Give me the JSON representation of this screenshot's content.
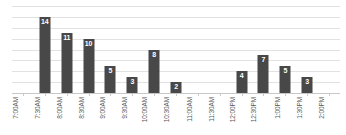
{
  "chart_data": {
    "type": "bar",
    "title": "",
    "subtitle": "",
    "xlabel": "",
    "ylabel": "",
    "categories": [
      "7:00AM",
      "7:30AM",
      "8:00AM",
      "8:30AM",
      "9:00AM",
      "9:30AM",
      "10:00AM",
      "10:30AM",
      "11:00AM",
      "11:30AM",
      "12:00PM",
      "12:30PM",
      "1:00PM",
      "1:30PM",
      "2:00PM"
    ],
    "values": [
      0,
      14,
      11,
      10,
      5,
      3,
      8,
      2,
      0,
      0,
      4,
      7,
      5,
      3,
      0
    ],
    "value_labels": [
      "",
      "14",
      "11",
      "10",
      "5",
      "3",
      "8",
      "2",
      "",
      "",
      "4",
      "7",
      "5",
      "3",
      ""
    ],
    "ylim": [
      0,
      16
    ],
    "y_gridline_values": [
      2,
      4,
      6,
      8,
      10,
      12,
      14,
      16
    ],
    "grid": true,
    "grid_axis": "y",
    "y_axis_visible": false,
    "y_tick_labels_visible": false,
    "legend": false,
    "legend_position": "none",
    "data_labels_inside_bars": true,
    "x_tick_label_rotation": -90,
    "colors": {
      "bar": "#484848",
      "gridline": "#e2e2e2",
      "axis_line": "#c8c8c8",
      "tick": "#c8c8c8",
      "data_label_text": "#ffffff",
      "x_tick_label_text": "#5a5a5a",
      "background": "#ffffff"
    }
  }
}
